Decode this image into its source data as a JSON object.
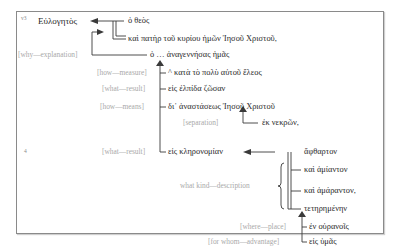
{
  "verse_markers": [
    "v3",
    "4"
  ],
  "words": {
    "eulogetos": "Εὐλογητὸς",
    "ho_theos": "ὁ θεὸς",
    "kai_pater": "καὶ πατὴρ τοῦ κυρίου ἡμῶν Ἰησοῦ Χριστοῦ,",
    "ho_anagennesas": "ὁ … ἀναγεννήσας ἡμᾶς",
    "kata": "^ κατὰ τὸ πολὺ αὐτοῦ ἔλεος",
    "eis_elpida": "εἰς ἐλπίδα ζῶσαν",
    "di_anastaseos": "δι᾽ ἀναστάσεως Ἰησοῦ Χριστοῦ",
    "ek_nekron": "ἐκ νεκρῶν,",
    "eis_kleronomian": "εἰς κληρονομίαν",
    "aphtharton": "ἄφθαρτον",
    "kai_amianton": "καὶ ἀμίαντον",
    "kai_amaranton": "καὶ ἀμάραντον,",
    "teteremenen": "τετηρημένην",
    "en_ouranois": "ἐν οὐρανοῖς",
    "eis_humas": "εἰς ὑμᾶς"
  },
  "labels": {
    "why": "[why—explanation]",
    "how_measure": "[how—measure]",
    "what_result_1": "[what—result]",
    "how_means": "[how—means]",
    "separation": "[separation]",
    "what_result_2": "[what—result]",
    "what_kind": "what kind—description",
    "where_place": "[where—place]",
    "for_whom": "[for whom—advantage]"
  },
  "colors": {
    "text": "#2a2a2a",
    "label": "#a9a9a9",
    "line": "#3a3a3a",
    "border": "#8a8a8a"
  }
}
